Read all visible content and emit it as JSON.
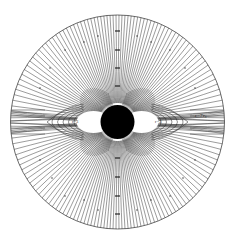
{
  "figure": {
    "type": "magnetic field line diagram",
    "background": "#ffffff",
    "ink": "#111111",
    "boundary_circle": {
      "cx": 117.5,
      "cy": 122,
      "r": 107
    },
    "central_body": {
      "cx": 117.5,
      "cy": 122,
      "r": 17,
      "fill": "#000000"
    },
    "cusps": [
      {
        "x": 47,
        "y": 122
      },
      {
        "x": 188,
        "y": 122
      }
    ],
    "axis_ticks_y": [
      31,
      50,
      68,
      86,
      158,
      177,
      196,
      214
    ],
    "labels": {
      "right_label": "r=7r₀",
      "left_inner_label": "r=3",
      "right_inner_label": "r=3"
    }
  }
}
